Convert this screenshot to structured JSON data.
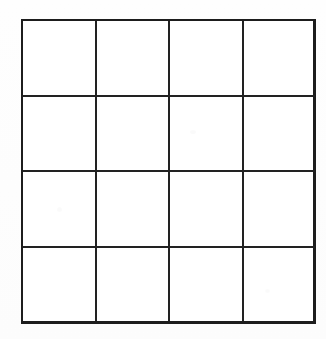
{
  "document": {
    "kind": "scanned-blank-grid",
    "background_color": "#fdfdfd",
    "paper_color": "#ffffff",
    "line_color": "#1d1d1d"
  },
  "grid": {
    "rows": 4,
    "columns": 4,
    "outer_border_px": 3,
    "inner_line_px": 2,
    "bounds": {
      "left": 21,
      "top": 19,
      "width": 295,
      "height": 305
    },
    "column_edges_px": [
      21,
      95,
      168,
      242,
      316
    ],
    "row_edges_px": [
      19,
      96,
      172,
      248,
      324
    ],
    "cells": [
      [
        "",
        "",
        "",
        ""
      ],
      [
        "",
        "",
        "",
        ""
      ],
      [
        "",
        "",
        "",
        ""
      ],
      [
        "",
        "",
        "",
        ""
      ]
    ]
  }
}
